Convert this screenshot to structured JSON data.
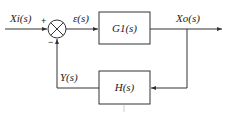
{
  "diagram": {
    "type": "closed-loop block diagram",
    "input_label": "X_i(s)",
    "input_text": "Xi(s)",
    "error_label": "ε(s)",
    "output_label": "X_o(s)",
    "output_text": "Xo(s)",
    "feedback_label": "Y(s)",
    "forward_block": "G1(s)",
    "feedback_block": "H(s)",
    "plus_sign": "+",
    "minus_sign": "−"
  }
}
